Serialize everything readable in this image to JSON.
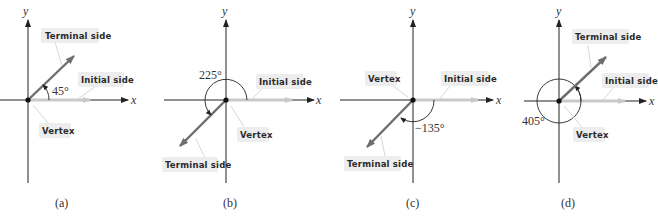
{
  "colors": {
    "axis": "#222222",
    "terminal_ray": "#6e6e6e",
    "initial_ray": "#c9c9c9",
    "label_box": "#ededed",
    "leader_line": "#d8d8d8"
  },
  "axes": {
    "x_label": "x",
    "y_label": "y"
  },
  "labels": {
    "terminal": "Terminal side",
    "initial": "Initial side",
    "vertex": "Vertex"
  },
  "panels": [
    {
      "caption": "(a)",
      "angle_label": "45°",
      "angle_deg": 45,
      "direction": "counterclockwise"
    },
    {
      "caption": "(b)",
      "angle_label": "225°",
      "angle_deg": 225,
      "direction": "counterclockwise"
    },
    {
      "caption": "(c)",
      "angle_label": "−135°",
      "angle_deg": -135,
      "direction": "clockwise"
    },
    {
      "caption": "(d)",
      "angle_label": "405°",
      "angle_deg": 405,
      "direction": "counterclockwise"
    }
  ],
  "stray_x_label": "x"
}
